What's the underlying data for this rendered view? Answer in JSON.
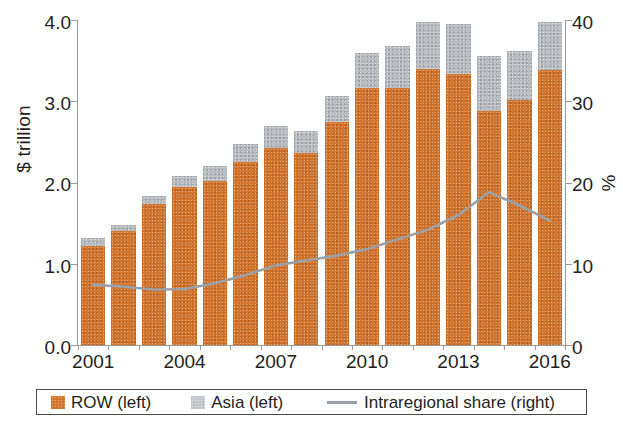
{
  "chart_data": {
    "type": "bar",
    "title": "",
    "subtitle": "",
    "xlabel": "",
    "ylabel": "$ trillion",
    "y2label": "%",
    "ylim": [
      0.0,
      4.0
    ],
    "y2lim": [
      0,
      40
    ],
    "xlim_years": [
      2001,
      2016
    ],
    "grid": false,
    "legend_position": "bottom",
    "stacked": true,
    "categories": [
      "2001",
      "2002",
      "2003",
      "2004",
      "2005",
      "2006",
      "2007",
      "2008",
      "2009",
      "2010",
      "2011",
      "2012",
      "2013",
      "2014",
      "2015",
      "2016"
    ],
    "x_tick_labels": [
      "2001",
      "2004",
      "2007",
      "2010",
      "2013",
      "2016"
    ],
    "y_tick_labels": [
      "0.0",
      "1.0",
      "2.0",
      "3.0",
      "4.0"
    ],
    "y_tick_values": [
      0.0,
      1.0,
      2.0,
      3.0,
      4.0
    ],
    "y2_tick_labels": [
      "0",
      "10",
      "20",
      "30",
      "40"
    ],
    "y2_tick_values": [
      0,
      10,
      20,
      30,
      40
    ],
    "series": [
      {
        "name": "ROW (left)",
        "kind": "bar",
        "axis": "left",
        "unit": "$ trillion",
        "color": "#d2762f",
        "values": [
          1.22,
          1.4,
          1.73,
          1.95,
          2.02,
          2.25,
          2.43,
          2.36,
          2.74,
          3.16,
          3.16,
          3.4,
          3.33,
          2.88,
          3.02,
          3.38
        ]
      },
      {
        "name": "Asia (left)",
        "kind": "bar",
        "axis": "left",
        "unit": "$ trillion",
        "color": "#b9bcc0",
        "values": [
          0.1,
          0.08,
          0.1,
          0.13,
          0.18,
          0.22,
          0.27,
          0.28,
          0.32,
          0.44,
          0.52,
          0.58,
          0.62,
          0.68,
          0.6,
          0.6
        ]
      },
      {
        "name": "Intraregional share (right)",
        "kind": "line",
        "axis": "right",
        "unit": "%",
        "color": "#9aa0a8",
        "values": [
          7.4,
          7.2,
          6.8,
          6.9,
          7.6,
          8.6,
          9.8,
          10.4,
          11.0,
          11.8,
          13.0,
          14.2,
          16.0,
          18.8,
          17.2,
          15.3
        ]
      }
    ],
    "totals": [
      1.32,
      1.48,
      1.83,
      2.08,
      2.2,
      2.47,
      2.7,
      2.64,
      3.06,
      3.6,
      3.68,
      3.98,
      3.95,
      3.56,
      3.62,
      3.98
    ]
  },
  "legend": {
    "items": [
      {
        "label": "ROW (left)",
        "swatch": "orange-square"
      },
      {
        "label": "Asia (left)",
        "swatch": "gray-square"
      },
      {
        "label": "Intraregional share (right)",
        "swatch": "gray-line"
      }
    ]
  },
  "colors": {
    "row": "#d2762f",
    "asia": "#b9bcc0",
    "line": "#9aa0a8",
    "axis": "#9a9a9a",
    "text": "#231f20"
  }
}
